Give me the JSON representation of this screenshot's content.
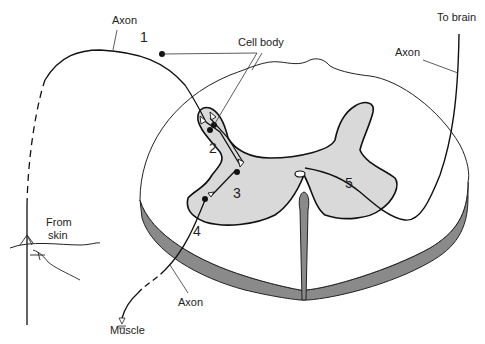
{
  "diagram": {
    "labels": {
      "axon_top": "Axon",
      "cell_body": "Cell body",
      "to_brain": "To brain",
      "axon_right": "Axon",
      "from_skin": "From",
      "from_skin_2": "skin",
      "axon_bottom": "Axon",
      "muscle": "Muscle"
    },
    "numbers": {
      "n1": "1",
      "n2": "2",
      "n3": "3",
      "n4": "4",
      "n5": "5"
    },
    "colors": {
      "grey_matter": "#d9d9d9",
      "cord_edge": "#8a8a8a",
      "line": "#111111"
    }
  }
}
